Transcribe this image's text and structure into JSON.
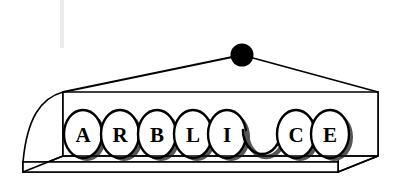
{
  "figure": {
    "background_color": "#ffffff",
    "line_color": "#000000",
    "fill_color": "#ffffff",
    "shadow_color": "#555555",
    "hanger_color": "#000000",
    "smudge_color": "#e8e8e8",
    "width": 401,
    "height": 189
  },
  "hanger": {
    "name": "suspension-point",
    "cx": 242,
    "cy": 55,
    "r": 11.5,
    "color": "#000000",
    "cables": [
      {
        "name": "left-cable",
        "x1": 242,
        "y1": 55,
        "x2": 63,
        "y2": 92
      },
      {
        "name": "right-cable",
        "x1": 242,
        "y1": 55,
        "x2": 378,
        "y2": 92
      }
    ]
  },
  "tray": {
    "name": "letter-tray",
    "top_rail": {
      "x": 63,
      "y": 92,
      "width": 315,
      "height": 0
    },
    "base": {
      "x": 23,
      "y": 172,
      "width": 315,
      "height": 0
    },
    "left_post_x": 63,
    "right_post_x": 378,
    "left_base_x": 23,
    "right_base_x": 338,
    "top_y": 92,
    "bottom_y": 172,
    "curve_sweep": 38
  },
  "tiles": {
    "name": "letter-tiles",
    "count": 8,
    "rx": 19,
    "ry": 24,
    "cy": 134,
    "first_cx": 83,
    "spacing": 37,
    "shadow_offset_x": 4,
    "shadow_offset_y": 3,
    "items": [
      {
        "index": 0,
        "label": "A",
        "occupied": true,
        "cx": 83
      },
      {
        "index": 1,
        "label": "R",
        "occupied": true,
        "cx": 120
      },
      {
        "index": 2,
        "label": "B",
        "occupied": true,
        "cx": 157
      },
      {
        "index": 3,
        "label": "L",
        "occupied": true,
        "cx": 193
      },
      {
        "index": 4,
        "label": "I",
        "occupied": true,
        "cx": 227
      },
      {
        "index": 5,
        "label": "",
        "occupied": false,
        "cx": 262
      },
      {
        "index": 6,
        "label": "C",
        "occupied": true,
        "cx": 296
      },
      {
        "index": 7,
        "label": "E",
        "occupied": true,
        "cx": 330
      }
    ],
    "sequence": "ARBLI CE"
  },
  "smudge": {
    "name": "paper-smudge",
    "x": 60,
    "y": 0,
    "width": 4,
    "height": 48
  }
}
